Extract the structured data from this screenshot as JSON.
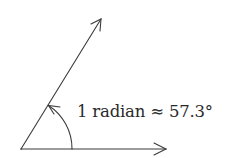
{
  "diagram": {
    "label": "1 radian ≈ 57.3°",
    "angle_label_value": "57.3°",
    "unit": "radian",
    "stroke_color": "#3a3a3a",
    "text_color": "#2a2a2a",
    "elements": {
      "horizontal_ray": "initial side with arrowhead",
      "inclined_ray": "terminal side with arrowhead",
      "arc": "angle arc with arrowhead indicating 1 radian"
    }
  }
}
